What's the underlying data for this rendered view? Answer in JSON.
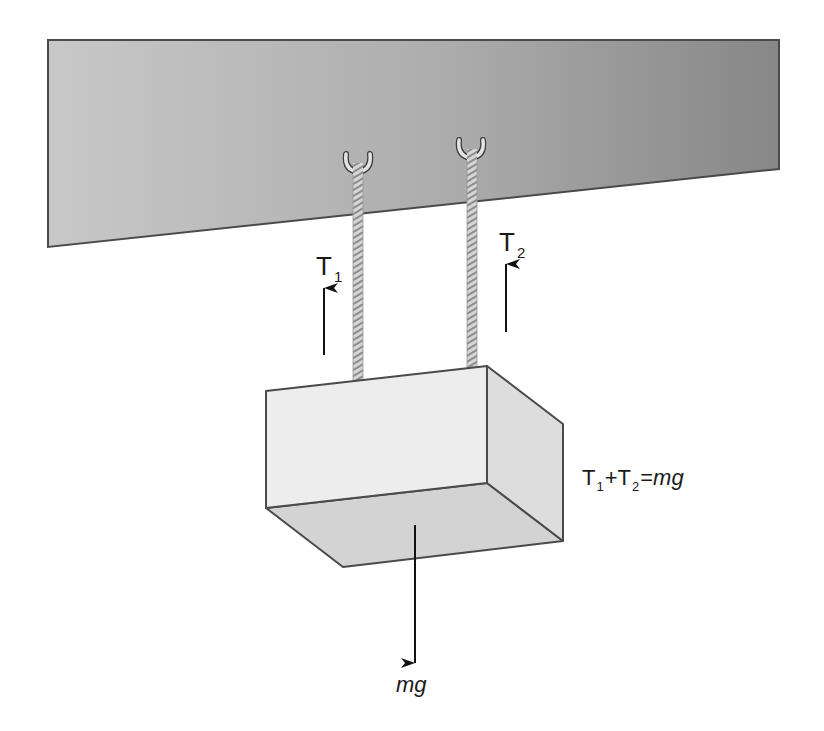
{
  "figure": {
    "type": "free-body diagram"
  },
  "colors": {
    "background": "#ffffff",
    "ceiling_light": "#c6c6c6",
    "ceiling_dark": "#8a8a8a",
    "outline": "#4a4a4a",
    "block_front": "#ededed",
    "block_side": "#dddddd",
    "block_bottom": "#d3d3d3",
    "rope_light": "#d8d8d8",
    "rope_dark": "#8c8c8c",
    "hook_fill": "#e6e6e6",
    "arrow": "#111111",
    "text": "#1a1a1a"
  },
  "ceiling": {
    "points": [
      [
        48,
        40
      ],
      [
        779,
        40
      ],
      [
        779,
        169
      ],
      [
        48,
        247
      ]
    ]
  },
  "ropes": [
    {
      "id": "rope-1",
      "x": 358,
      "top": 164,
      "bottom": 381,
      "width": 10
    },
    {
      "id": "rope-2",
      "x": 472,
      "top": 150,
      "bottom": 367,
      "width": 10
    }
  ],
  "hooks": [
    {
      "id": "hook-1",
      "cx": 358,
      "top": 152,
      "bottom": 172
    },
    {
      "id": "hook-2",
      "cx": 471,
      "top": 138,
      "bottom": 158
    }
  ],
  "block": {
    "front": [
      [
        266,
        391
      ],
      [
        487,
        366
      ],
      [
        487,
        483
      ],
      [
        266,
        508
      ]
    ],
    "side": [
      [
        487,
        366
      ],
      [
        563,
        424
      ],
      [
        563,
        541
      ],
      [
        487,
        483
      ]
    ],
    "bottom": [
      [
        266,
        508
      ],
      [
        487,
        483
      ],
      [
        563,
        541
      ],
      [
        343,
        567
      ]
    ]
  },
  "forces": {
    "T1": {
      "label": "T",
      "subscript": "1",
      "direction": "up",
      "x": 324,
      "y_tail": 355,
      "y_tip": 286
    },
    "T2": {
      "label": "T",
      "subscript": "2",
      "direction": "up",
      "x": 506,
      "y_tail": 332,
      "y_tip": 262
    },
    "weight": {
      "label": "mg",
      "direction": "down",
      "x": 415,
      "y_tail": 525,
      "y_tip": 665
    }
  },
  "equation": {
    "t1": "T",
    "t1_sub": "1",
    "plus": "+",
    "t2": "T",
    "t2_sub": "2",
    "equals": "=",
    "rhs": "mg",
    "full_text": "T1+T2=mg"
  }
}
